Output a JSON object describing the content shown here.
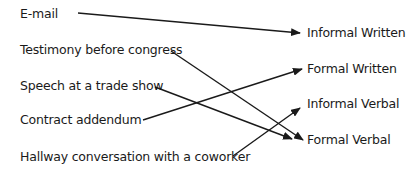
{
  "diagram": {
    "type": "matching-arrows",
    "line_color": "#1a1a1a",
    "left_items": [
      {
        "label": "E-mail",
        "x": 20,
        "y": 7
      },
      {
        "label": "Testimony before congress",
        "x": 20,
        "y": 43
      },
      {
        "label": "Speech at a trade show",
        "x": 20,
        "y": 79
      },
      {
        "label": "Contract addendum",
        "x": 20,
        "y": 113
      },
      {
        "label": "Hallway conversation with a coworker",
        "x": 20,
        "y": 150
      }
    ],
    "right_items": [
      {
        "label": "Informal Written",
        "x": 307,
        "y": 26
      },
      {
        "label": "Formal Written",
        "x": 307,
        "y": 62
      },
      {
        "label": "Informal Verbal",
        "x": 307,
        "y": 97
      },
      {
        "label": "Formal Verbal",
        "x": 307,
        "y": 133
      }
    ],
    "connections": [
      {
        "from": "E-mail",
        "to": "Informal Written",
        "x1": 78,
        "y1": 13,
        "x2": 300,
        "y2": 33
      },
      {
        "from": "Testimony before congress",
        "to": "Formal Verbal",
        "x1": 171,
        "y1": 51,
        "x2": 303,
        "y2": 140
      },
      {
        "from": "Speech at a trade show",
        "to": "Formal Verbal",
        "x1": 155,
        "y1": 87,
        "x2": 292,
        "y2": 139
      },
      {
        "from": "Contract addendum",
        "to": "Formal Written",
        "x1": 143,
        "y1": 120,
        "x2": 302,
        "y2": 69
      },
      {
        "from": "Hallway conversation with a coworker",
        "to": "Informal Verbal",
        "x1": 233,
        "y1": 156,
        "x2": 300,
        "y2": 108
      }
    ]
  }
}
